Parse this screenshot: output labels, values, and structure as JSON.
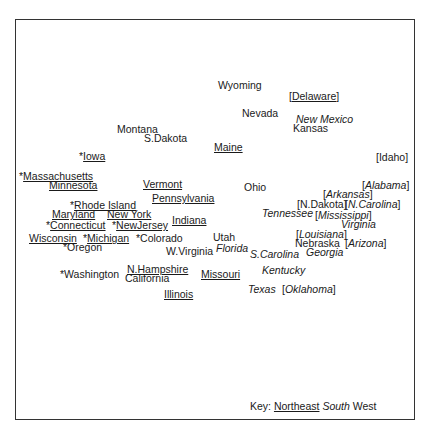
{
  "chart_data": {
    "type": "scatter",
    "title": "",
    "xlabel": "",
    "ylabel": "",
    "grid": false,
    "legend": {
      "position": "bottom-right",
      "prefix": "Key:",
      "entries": [
        {
          "name": "Northeast",
          "style": "underline"
        },
        {
          "name": "South",
          "style": "italic"
        },
        {
          "name": "West",
          "style": "plain"
        }
      ]
    },
    "points": [
      {
        "label": "Wyoming",
        "region": "West",
        "pre": "",
        "bracket": false,
        "x": 218,
        "y": 80
      },
      {
        "label": "Delaware",
        "region": "Northeast",
        "pre": "",
        "bracket": true,
        "x": 289,
        "y": 91
      },
      {
        "label": "Nevada",
        "region": "West",
        "pre": "",
        "bracket": false,
        "x": 242,
        "y": 108
      },
      {
        "label": "New Mexico",
        "region": "South",
        "pre": "",
        "bracket": false,
        "x": 296,
        "y": 114
      },
      {
        "label": "Kansas",
        "region": "West",
        "pre": "",
        "bracket": false,
        "x": 293,
        "y": 123
      },
      {
        "label": "Montana",
        "region": "West",
        "pre": "",
        "bracket": false,
        "x": 117,
        "y": 124
      },
      {
        "label": "S.Dakota",
        "region": "West",
        "pre": "",
        "bracket": false,
        "x": 144,
        "y": 133
      },
      {
        "label": "Maine",
        "region": "Northeast",
        "pre": "",
        "bracket": false,
        "x": 214,
        "y": 142
      },
      {
        "label": "Iowa",
        "region": "Northeast",
        "pre": "*",
        "bracket": false,
        "x": 79,
        "y": 151
      },
      {
        "label": "Idaho",
        "region": "West",
        "pre": "",
        "bracket": true,
        "x": 376,
        "y": 152
      },
      {
        "label": "Massachusetts",
        "region": "Northeast",
        "pre": "*",
        "bracket": false,
        "x": 19,
        "y": 171
      },
      {
        "label": "Minnesota",
        "region": "Northeast",
        "pre": "",
        "bracket": false,
        "x": 49,
        "y": 180
      },
      {
        "label": "Vermont",
        "region": "Northeast",
        "pre": "",
        "bracket": false,
        "x": 143,
        "y": 179
      },
      {
        "label": "Ohio",
        "region": "West",
        "pre": "",
        "bracket": false,
        "x": 244,
        "y": 182
      },
      {
        "label": "Alabama",
        "region": "South",
        "pre": "",
        "bracket": true,
        "x": 362,
        "y": 180
      },
      {
        "label": "Arkansas",
        "region": "South",
        "pre": "",
        "bracket": true,
        "x": 323,
        "y": 189
      },
      {
        "label": "Pennsylvania",
        "region": "Northeast",
        "pre": "",
        "bracket": false,
        "x": 152,
        "y": 193
      },
      {
        "label": "N.Dakota",
        "region": "West",
        "pre": "",
        "bracket": true,
        "x": 297,
        "y": 199
      },
      {
        "label": "N.Carolina",
        "region": "South",
        "pre": "",
        "bracket": true,
        "x": 345,
        "y": 199
      },
      {
        "label": "Rhode Island",
        "region": "Northeast",
        "pre": "*",
        "bracket": false,
        "x": 70,
        "y": 200
      },
      {
        "label": "Tennessee",
        "region": "South",
        "pre": "",
        "bracket": false,
        "x": 262,
        "y": 208
      },
      {
        "label": "Mississippi",
        "region": "South",
        "pre": "",
        "bracket": true,
        "x": 315,
        "y": 210
      },
      {
        "label": "Maryland",
        "region": "Northeast",
        "pre": "",
        "bracket": false,
        "x": 52,
        "y": 209
      },
      {
        "label": "New York",
        "region": "Northeast",
        "pre": "",
        "bracket": false,
        "x": 107,
        "y": 209
      },
      {
        "label": "Indiana",
        "region": "Northeast",
        "pre": "",
        "bracket": false,
        "x": 172,
        "y": 215
      },
      {
        "label": "Virginia",
        "region": "South",
        "pre": "",
        "bracket": false,
        "x": 341,
        "y": 219
      },
      {
        "label": "Connecticut",
        "region": "Northeast",
        "pre": "*",
        "bracket": false,
        "x": 46,
        "y": 220
      },
      {
        "label": "NewJersey",
        "region": "Northeast",
        "pre": "*",
        "bracket": false,
        "x": 112,
        "y": 220
      },
      {
        "label": "Louisiana",
        "region": "South",
        "pre": "",
        "bracket": true,
        "x": 296,
        "y": 229
      },
      {
        "label": "Wisconsin",
        "region": "Northeast",
        "pre": "",
        "bracket": false,
        "x": 29,
        "y": 233
      },
      {
        "label": "Michigan",
        "region": "Northeast",
        "pre": "*",
        "bracket": false,
        "x": 83,
        "y": 233
      },
      {
        "label": "Colorado",
        "region": "West",
        "pre": "*",
        "bracket": false,
        "x": 136,
        "y": 233
      },
      {
        "label": "Utah",
        "region": "West",
        "pre": "",
        "bracket": false,
        "x": 213,
        "y": 232
      },
      {
        "label": "Nebraska",
        "region": "West",
        "pre": "",
        "bracket": false,
        "x": 295,
        "y": 238
      },
      {
        "label": "Arizona",
        "region": "South",
        "pre": "",
        "bracket": true,
        "x": 345,
        "y": 238
      },
      {
        "label": "Oregon",
        "region": "West",
        "pre": "*",
        "bracket": false,
        "x": 63,
        "y": 242
      },
      {
        "label": "W.Virginia",
        "region": "West",
        "pre": "",
        "bracket": false,
        "x": 166,
        "y": 246
      },
      {
        "label": "Florida",
        "region": "South",
        "pre": "",
        "bracket": false,
        "x": 216,
        "y": 243
      },
      {
        "label": "S.Carolina",
        "region": "South",
        "pre": "",
        "bracket": false,
        "x": 250,
        "y": 249
      },
      {
        "label": "Georgia",
        "region": "South",
        "pre": "",
        "bracket": false,
        "x": 306,
        "y": 247
      },
      {
        "label": "N.Hampshire",
        "region": "Northeast",
        "pre": "",
        "bracket": false,
        "x": 127,
        "y": 264
      },
      {
        "label": "Washington",
        "region": "West",
        "pre": "*",
        "bracket": false,
        "x": 60,
        "y": 269
      },
      {
        "label": "California",
        "region": "West",
        "pre": "",
        "bracket": false,
        "x": 125,
        "y": 273
      },
      {
        "label": "Missouri",
        "region": "Northeast",
        "pre": "",
        "bracket": false,
        "x": 201,
        "y": 269
      },
      {
        "label": "Kentucky",
        "region": "South",
        "pre": "",
        "bracket": false,
        "x": 262,
        "y": 265
      },
      {
        "label": "Texas",
        "region": "South",
        "pre": "",
        "bracket": false,
        "x": 248,
        "y": 284
      },
      {
        "label": "Oklahoma",
        "region": "South",
        "pre": "",
        "bracket": true,
        "x": 282,
        "y": 284
      },
      {
        "label": "Illinois",
        "region": "Northeast",
        "pre": "",
        "bracket": false,
        "x": 164,
        "y": 289
      }
    ]
  }
}
